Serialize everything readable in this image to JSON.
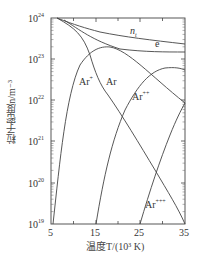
{
  "chart_data": {
    "type": "line",
    "title": "",
    "xlabel": "温度T/(10³ K)",
    "ylabel": "粒子密度n/m⁻³",
    "xlim": [
      5,
      35
    ],
    "ylim": [
      1e+19,
      1e+24
    ],
    "yscale": "log",
    "x_ticks": [
      "5",
      "15",
      "25",
      "35"
    ],
    "y_ticks": [
      "10^19",
      "10^20",
      "10^21",
      "10^22",
      "10^23",
      "10^24"
    ],
    "grid": false,
    "legend": "inline labels",
    "series": [
      {
        "name": "n_t",
        "x": [
          6,
          10,
          15,
          20,
          25,
          30,
          35
        ],
        "log10_y": [
          24.0,
          23.75,
          23.6,
          23.53,
          23.47,
          23.42,
          23.36
        ]
      },
      {
        "name": "e",
        "x": [
          10,
          15,
          20,
          25,
          30,
          35
        ],
        "log10_y": [
          23.75,
          23.45,
          23.28,
          23.2,
          23.17,
          23.16
        ]
      },
      {
        "name": "Ar",
        "x": [
          6,
          10,
          13,
          15,
          17,
          20,
          25,
          30,
          35
        ],
        "log10_y": [
          24.0,
          23.7,
          23.3,
          22.8,
          22.35,
          21.95,
          21.3,
          20.2,
          19.0
        ]
      },
      {
        "name": "Ar⁺",
        "x": [
          5.5,
          8,
          10,
          13,
          17,
          20,
          25,
          30,
          35
        ],
        "log10_y": [
          19.0,
          21.2,
          22.4,
          23.05,
          23.28,
          23.2,
          22.85,
          22.4,
          21.9
        ]
      },
      {
        "name": "Ar⁺⁺",
        "x": [
          15,
          18,
          20,
          22,
          25,
          28,
          31,
          35
        ],
        "log10_y": [
          19.0,
          20.8,
          21.6,
          22.2,
          22.7,
          22.85,
          22.85,
          22.8
        ]
      },
      {
        "name": "Ar⁺⁺⁺",
        "x": [
          25,
          28,
          30,
          33,
          35
        ],
        "log10_y": [
          19.0,
          20.2,
          20.8,
          21.5,
          21.9
        ]
      }
    ],
    "annotations": [
      "n_t",
      "e",
      "Ar⁺",
      "Ar",
      "Ar⁺⁺",
      "Ar⁺⁺⁺"
    ]
  },
  "labels": {
    "ylabel": "粒子密度n/m⁻³",
    "xlabel": "温度T/(10³ K)",
    "nt": "n",
    "nt_sub": "t",
    "e": "e",
    "ar": "Ar",
    "ar1": "Ar",
    "ar1_sup": "+",
    "ar2": "Ar",
    "ar2_sup": "++",
    "ar3": "Ar",
    "ar3_sup": "+++",
    "x_ticks": [
      "5",
      "15",
      "25",
      "35"
    ],
    "y_exp": [
      "24",
      "23",
      "22",
      "21",
      "20",
      "19"
    ]
  }
}
